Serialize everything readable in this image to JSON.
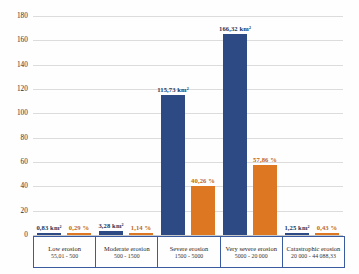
{
  "chart_data": {
    "type": "bar",
    "title": "",
    "subtitle": "",
    "xlabel": "",
    "ylabel": "",
    "ylim": [
      0,
      180
    ],
    "yticks": [
      0,
      20,
      40,
      60,
      80,
      100,
      120,
      140,
      160,
      180
    ],
    "grid": true,
    "legend_position": "none",
    "categories": [
      "Low erosion",
      "Moderate erosion",
      "Severe erosion",
      "Very severe erosion",
      "Catastrophic erosion"
    ],
    "category_ranges": [
      "55,01 - 500",
      "500 - 1500",
      "1500 - 5000",
      "5000 - 20 000",
      "20 000 - 44 088,33"
    ],
    "series": [
      {
        "name": "Area",
        "unit": "km²",
        "color": "#2e4a84",
        "values": [
          0.83,
          3.28,
          115.73,
          166.32,
          1.25
        ],
        "labels": [
          "0,83 km²",
          "3,28 km²",
          "115,73 km²",
          "166,32 km²",
          "1,25 km²"
        ]
      },
      {
        "name": "Share",
        "unit": "%",
        "color": "#dd7722",
        "values": [
          0.29,
          1.14,
          40.26,
          57.86,
          0.43
        ],
        "labels": [
          "0,29 %",
          "1,14 %",
          "40,26 %",
          "57,86 %",
          "0,43 %"
        ]
      }
    ]
  }
}
